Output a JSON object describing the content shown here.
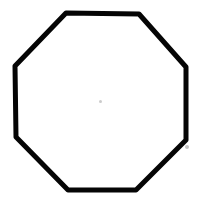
{
  "image": {
    "width": 202,
    "height": 205,
    "background_color": "#ffffff",
    "alt_text": "Black outlined regular octagon centered on a white background"
  },
  "shape": {
    "name": "octagon",
    "type": "regular-polygon",
    "sides": 8,
    "stroke_color": "#050505",
    "stroke_width": 5,
    "fill_color": "none",
    "line_join": "round",
    "line_cap": "round",
    "points": "66,13 139,14 186,67 186,140 136,190 68,190 16,137 15,66",
    "vertices": [
      {
        "label": "top-left",
        "x": 66,
        "y": 13
      },
      {
        "label": "top-right",
        "x": 139,
        "y": 14
      },
      {
        "label": "right-upper",
        "x": 186,
        "y": 67
      },
      {
        "label": "right-lower",
        "x": 186,
        "y": 140
      },
      {
        "label": "bottom-right",
        "x": 136,
        "y": 190
      },
      {
        "label": "bottom-left",
        "x": 68,
        "y": 190
      },
      {
        "label": "left-lower",
        "x": 16,
        "y": 137
      },
      {
        "label": "left-upper",
        "x": 15,
        "y": 66
      }
    ]
  },
  "marks": {
    "center_speck": {
      "name": "center-speck",
      "x": 99,
      "y": 100,
      "color": "#b9b9b9"
    },
    "corner_artifact": {
      "name": "corner-artifact",
      "x": 185,
      "y": 145,
      "color": "#9a9a9a"
    }
  }
}
